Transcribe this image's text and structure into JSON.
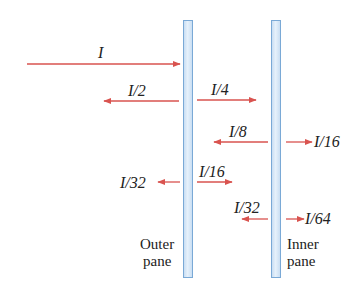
{
  "diagram": {
    "type": "light reflection and transmission through double-pane window",
    "arrow_color": "#d9534f",
    "pane_fill": "#cfe3f5",
    "pane_border": "#7aa9d6",
    "panes": [
      {
        "id": "outer",
        "label_line1": "Outer",
        "label_line2": "pane"
      },
      {
        "id": "inner",
        "label_line1": "Inner",
        "label_line2": "pane"
      }
    ],
    "beams": [
      {
        "label": "I",
        "direction": "right",
        "region": "incident"
      },
      {
        "label": "I/2",
        "direction": "left",
        "region": "reflected from outer"
      },
      {
        "label": "I/4",
        "direction": "right",
        "region": "between panes"
      },
      {
        "label": "I/8",
        "direction": "left",
        "region": "between panes"
      },
      {
        "label": "I/16",
        "direction": "right",
        "region": "transmitted through inner"
      },
      {
        "label": "I/32",
        "direction": "left",
        "region": "transmitted back through outer"
      },
      {
        "label": "I/16",
        "direction": "right",
        "region": "between panes"
      },
      {
        "label": "I/32",
        "direction": "left",
        "region": "between panes"
      },
      {
        "label": "I/64",
        "direction": "right",
        "region": "transmitted through inner"
      }
    ]
  }
}
